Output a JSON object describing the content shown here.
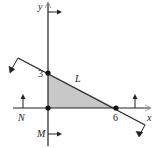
{
  "diagram": {
    "axis_labels": {
      "x": "x",
      "y": "y"
    },
    "line_label": "L",
    "boundary_labels": {
      "N": "N",
      "M": "M"
    },
    "intercepts": {
      "y_intercept": "3",
      "x_intercept": "6"
    },
    "region": {
      "vertices": [
        [
          0,
          0
        ],
        [
          0,
          3
        ],
        [
          6,
          0
        ]
      ],
      "fill": "#c8c8c8"
    },
    "line_equation_points": [
      [
        0,
        3
      ],
      [
        6,
        0
      ]
    ]
  }
}
